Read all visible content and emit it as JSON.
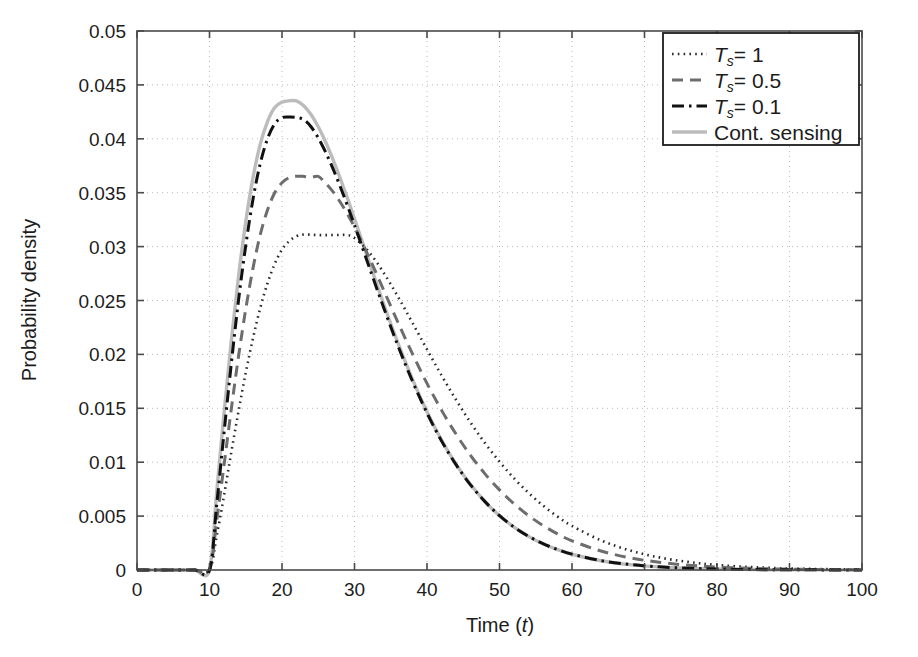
{
  "figure": {
    "background_color": "#ffffff",
    "axis_color": "#4a4a4a",
    "grid_color": "#b9b9b9",
    "plot_box": {
      "left": 137,
      "top": 31,
      "right": 862,
      "bottom": 570
    }
  },
  "axes": {
    "x": {
      "label_prefix": "Time (",
      "label_var": "t",
      "label_suffix": ")",
      "ticks": [
        "0",
        "10",
        "20",
        "30",
        "40",
        "50",
        "60",
        "70",
        "80",
        "90",
        "100"
      ],
      "min": 0,
      "max": 100
    },
    "y": {
      "label": "Probability density",
      "ticks": [
        "0",
        "0.005",
        "0.01",
        "0.015",
        "0.02",
        "0.025",
        "0.03",
        "0.035",
        "0.04",
        "0.045",
        "0.05"
      ],
      "min": 0,
      "max": 0.05
    }
  },
  "legend": {
    "position": "top-right",
    "border_color": "#1c1c1c",
    "background": "#ffffff",
    "items": [
      {
        "name": "ts-1",
        "prefix": "T",
        "sub": "s",
        "suffix": "= 1",
        "style": "dotted",
        "color": "#2a2a2a"
      },
      {
        "name": "ts-05",
        "prefix": "T",
        "sub": "s",
        "suffix": "= 0.5",
        "style": "dashed",
        "color": "#6d6d6d"
      },
      {
        "name": "ts-01",
        "prefix": "T",
        "sub": "s",
        "suffix": "= 0.1",
        "style": "dashdot",
        "color": "#111111"
      },
      {
        "name": "cont",
        "prefix": "",
        "sub": "",
        "suffix": "Cont. sensing",
        "style": "solid",
        "color": "#bcbcbc"
      }
    ]
  },
  "chart_data": {
    "type": "line",
    "title": "",
    "xlabel": "Time (t)",
    "ylabel": "Probability density",
    "xlim": [
      0,
      100
    ],
    "ylim": [
      0,
      0.05
    ],
    "grid": true,
    "legend_position": "top-right",
    "x": [
      0,
      2,
      4,
      6,
      8,
      10,
      11,
      12,
      13,
      14,
      15,
      16,
      17,
      18,
      19,
      20,
      21,
      22,
      23,
      24,
      25,
      26,
      27,
      28,
      29,
      30,
      32,
      34,
      36,
      38,
      40,
      42,
      44,
      46,
      48,
      50,
      52,
      54,
      56,
      58,
      60,
      64,
      68,
      72,
      76,
      80,
      85,
      90,
      95,
      100
    ],
    "series": [
      {
        "name": "Cont. sensing",
        "style": "solid",
        "color": "#bcbcbc",
        "peak_x": 22,
        "peak_y": 0.0435,
        "values": [
          0,
          0,
          0,
          0,
          0,
          0.0,
          0.0073,
          0.0145,
          0.0212,
          0.0272,
          0.0323,
          0.0364,
          0.0395,
          0.0416,
          0.0429,
          0.0434,
          0.04353,
          0.04352,
          0.04307,
          0.04225,
          0.04112,
          0.03973,
          0.03814,
          0.03639,
          0.03453,
          0.03259,
          0.02862,
          0.02472,
          0.02104,
          0.01768,
          0.01468,
          0.01206,
          0.00982,
          0.00793,
          0.00635,
          0.00504,
          0.00398,
          0.00312,
          0.00243,
          0.00189,
          0.00146,
          0.00086,
          0.0005,
          0.00029,
          0.00016,
          9e-05,
          4e-05,
          2e-05,
          1e-05,
          4e-06
        ]
      },
      {
        "name": "Ts = 0.1",
        "style": "dashdot",
        "color": "#111111",
        "peak_x": 23,
        "peak_y": 0.042,
        "values": [
          0,
          0,
          0,
          0,
          0,
          0.0,
          0.0061,
          0.0127,
          0.0191,
          0.025,
          0.0301,
          0.0344,
          0.0377,
          0.04,
          0.0414,
          0.04196,
          0.04202,
          0.04198,
          0.04177,
          0.04112,
          0.04008,
          0.03878,
          0.03728,
          0.03562,
          0.03385,
          0.03199,
          0.02816,
          0.02438,
          0.02079,
          0.0175,
          0.01456,
          0.01198,
          0.00977,
          0.0079,
          0.00634,
          0.00504,
          0.00398,
          0.00313,
          0.00244,
          0.0019,
          0.00147,
          0.00087,
          0.00051,
          0.00029,
          0.00017,
          9e-05,
          4e-05,
          2e-05,
          1e-05,
          4e-06
        ]
      },
      {
        "name": "Ts = 0.5",
        "style": "dashed",
        "color": "#6d6d6d",
        "peak_x": 25,
        "peak_y": 0.0365,
        "values": [
          0,
          0,
          0,
          0,
          0,
          0.0,
          0.0046,
          0.0097,
          0.0149,
          0.0198,
          0.0242,
          0.028,
          0.0311,
          0.0334,
          0.035,
          0.03593,
          0.0364,
          0.03653,
          0.03651,
          0.03643,
          0.03651,
          0.03589,
          0.03512,
          0.03416,
          0.03305,
          0.0318,
          0.02901,
          0.026,
          0.02296,
          0.02004,
          0.01731,
          0.01483,
          0.01261,
          0.01064,
          0.00892,
          0.00743,
          0.00614,
          0.00505,
          0.00413,
          0.00335,
          0.00271,
          0.00176,
          0.00113,
          0.00072,
          0.00045,
          0.00028,
          0.00015,
          8e-05,
          4e-05,
          2e-05
        ]
      },
      {
        "name": "Ts = 1",
        "style": "dotted",
        "color": "#2a2a2a",
        "peak_x": 29,
        "peak_y": 0.0311,
        "values": [
          0,
          0,
          0,
          0,
          0,
          0.0,
          0.0032,
          0.0069,
          0.0109,
          0.0147,
          0.0183,
          0.0215,
          0.0243,
          0.0266,
          0.0284,
          0.02972,
          0.03051,
          0.03096,
          0.03112,
          0.0311,
          0.03107,
          0.03106,
          0.03107,
          0.03108,
          0.03107,
          0.0308,
          0.0295,
          0.0276,
          0.02535,
          0.02292,
          0.02046,
          0.01806,
          0.01579,
          0.01369,
          0.01177,
          0.01005,
          0.00851,
          0.00716,
          0.00598,
          0.00496,
          0.00409,
          0.00275,
          0.00181,
          0.00117,
          0.00075,
          0.00047,
          0.00026,
          0.00014,
          8e-05,
          4e-05
        ]
      }
    ]
  }
}
